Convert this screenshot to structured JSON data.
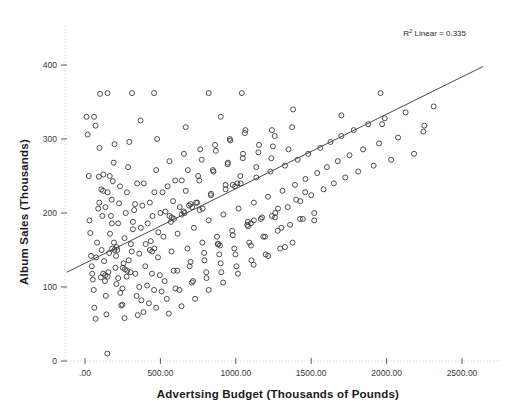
{
  "chart_data": {
    "type": "scatter",
    "title": "",
    "xlabel": "Advertsing Budget (Thousands of Pounds)",
    "ylabel": "Album Sales (Thousands)",
    "xlim": [
      -150,
      2700
    ],
    "ylim": [
      0,
      430
    ],
    "xticks": [
      0,
      500,
      1000,
      1500,
      2000,
      2500
    ],
    "xticklabels": [
      ".00",
      "500.00",
      "1000.00",
      "1500.00",
      "2000.00",
      "2500.00"
    ],
    "yticks": [
      0,
      100,
      200,
      300,
      400
    ],
    "yticklabels": [
      "0",
      "100",
      "200",
      "300",
      "400"
    ],
    "grid": false,
    "legend": null,
    "annotation": {
      "text_prefix": "R",
      "text_sup": "2",
      "text_suffix": " Linear = 0.335",
      "full_text": "R² Linear = 0.335",
      "r_squared": 0.335
    },
    "fit_line": {
      "type": "linear",
      "x_start": -120,
      "y_start": 120,
      "x_end": 2640,
      "y_end": 398,
      "slope": 0.1007,
      "intercept": 132.1
    },
    "marker_style": {
      "shape": "open-circle",
      "size": 5,
      "stroke": "#3b3b3b",
      "fill": "none"
    },
    "series": [
      {
        "name": "Album Sales vs Advertising Budget",
        "points": [
          [
            10,
            330
          ],
          [
            18,
            306
          ],
          [
            25,
            250
          ],
          [
            30,
            190
          ],
          [
            35,
            173
          ],
          [
            40,
            142
          ],
          [
            45,
            128
          ],
          [
            48,
            118
          ],
          [
            52,
            110
          ],
          [
            58,
            96
          ],
          [
            62,
            72
          ],
          [
            70,
            57
          ],
          [
            74,
            140
          ],
          [
            80,
            160
          ],
          [
            88,
            206
          ],
          [
            92,
            249
          ],
          [
            96,
            288
          ],
          [
            100,
            361
          ],
          [
            105,
            113
          ],
          [
            110,
            150
          ],
          [
            115,
            196
          ],
          [
            120,
            230
          ],
          [
            126,
            135
          ],
          [
            132,
            108
          ],
          [
            138,
            88
          ],
          [
            142,
            63
          ],
          [
            148,
            10
          ],
          [
            155,
            120
          ],
          [
            160,
            146
          ],
          [
            166,
            172
          ],
          [
            172,
            196
          ],
          [
            178,
            218
          ],
          [
            184,
            243
          ],
          [
            190,
            268
          ],
          [
            196,
            293
          ],
          [
            202,
            126
          ],
          [
            208,
            104
          ],
          [
            214,
            150
          ],
          [
            220,
            186
          ],
          [
            226,
            213
          ],
          [
            232,
            236
          ],
          [
            240,
            75
          ],
          [
            248,
            98
          ],
          [
            256,
            132
          ],
          [
            262,
            166
          ],
          [
            270,
            200
          ],
          [
            278,
            228
          ],
          [
            286,
            262
          ],
          [
            294,
            296
          ],
          [
            302,
            120
          ],
          [
            310,
            148
          ],
          [
            318,
            178
          ],
          [
            326,
            204
          ],
          [
            334,
            118
          ],
          [
            342,
            88
          ],
          [
            350,
            62
          ],
          [
            360,
            145
          ],
          [
            370,
            180
          ],
          [
            380,
            210
          ],
          [
            390,
            240
          ],
          [
            400,
            128
          ],
          [
            412,
            102
          ],
          [
            424,
            78
          ],
          [
            436,
            162
          ],
          [
            448,
            196
          ],
          [
            460,
            228
          ],
          [
            472,
            258
          ],
          [
            484,
            140
          ],
          [
            496,
            116
          ],
          [
            508,
            94
          ],
          [
            520,
            168
          ],
          [
            534,
            202
          ],
          [
            548,
            236
          ],
          [
            560,
            270
          ],
          [
            574,
            148
          ],
          [
            588,
            122
          ],
          [
            600,
            98
          ],
          [
            614,
            172
          ],
          [
            628,
            208
          ],
          [
            642,
            244
          ],
          [
            656,
            280
          ],
          [
            668,
            316
          ],
          [
            680,
            152
          ],
          [
            694,
            128
          ],
          [
            708,
            106
          ],
          [
            722,
            180
          ],
          [
            736,
            214
          ],
          [
            750,
            250
          ],
          [
            764,
            286
          ],
          [
            778,
            160
          ],
          [
            792,
            136
          ],
          [
            806,
            112
          ],
          [
            820,
            190
          ],
          [
            834,
            224
          ],
          [
            848,
            258
          ],
          [
            862,
            292
          ],
          [
            876,
            168
          ],
          [
            890,
            144
          ],
          [
            904,
            120
          ],
          [
            918,
            198
          ],
          [
            932,
            232
          ],
          [
            946,
            266
          ],
          [
            960,
            300
          ],
          [
            976,
            176
          ],
          [
            990,
            152
          ],
          [
            1004,
            128
          ],
          [
            1018,
            206
          ],
          [
            1032,
            240
          ],
          [
            1046,
            274
          ],
          [
            1060,
            308
          ],
          [
            1076,
            184
          ],
          [
            1090,
            160
          ],
          [
            1104,
            136
          ],
          [
            1120,
            214
          ],
          [
            1136,
            248
          ],
          [
            1150,
            282
          ],
          [
            1166,
            192
          ],
          [
            1182,
            168
          ],
          [
            1198,
            144
          ],
          [
            1214,
            222
          ],
          [
            1230,
            256
          ],
          [
            1246,
            290
          ],
          [
            1262,
            200
          ],
          [
            1278,
            176
          ],
          [
            1294,
            152
          ],
          [
            1310,
            230
          ],
          [
            1326,
            264
          ],
          [
            1344,
            208
          ],
          [
            1360,
            184
          ],
          [
            1376,
            160
          ],
          [
            1392,
            238
          ],
          [
            1410,
            272
          ],
          [
            1428,
            216
          ],
          [
            1444,
            192
          ],
          [
            1462,
            246
          ],
          [
            1480,
            280
          ],
          [
            1500,
            224
          ],
          [
            1520,
            200
          ],
          [
            1540,
            254
          ],
          [
            1560,
            288
          ],
          [
            1582,
            232
          ],
          [
            1604,
            262
          ],
          [
            1628,
            296
          ],
          [
            1650,
            240
          ],
          [
            1676,
            270
          ],
          [
            1700,
            304
          ],
          [
            1726,
            248
          ],
          [
            1754,
            278
          ],
          [
            1782,
            312
          ],
          [
            1812,
            256
          ],
          [
            1844,
            286
          ],
          [
            1878,
            320
          ],
          [
            1914,
            264
          ],
          [
            1950,
            294
          ],
          [
            1988,
            328
          ],
          [
            2030,
            272
          ],
          [
            2076,
            302
          ],
          [
            2126,
            336
          ],
          [
            2182,
            280
          ],
          [
            2244,
            310
          ],
          [
            2312,
            344
          ],
          [
            95,
            214
          ],
          [
            108,
            232
          ],
          [
            122,
            252
          ],
          [
            136,
            208
          ],
          [
            150,
            228
          ],
          [
            164,
            250
          ],
          [
            178,
            186
          ],
          [
            192,
            160
          ],
          [
            206,
            142
          ],
          [
            220,
            112
          ],
          [
            234,
            92
          ],
          [
            248,
            76
          ],
          [
            262,
            58
          ],
          [
            276,
            114
          ],
          [
            290,
            136
          ],
          [
            304,
            158
          ],
          [
            318,
            188
          ],
          [
            332,
            212
          ],
          [
            346,
            240
          ],
          [
            360,
            100
          ],
          [
            374,
            82
          ],
          [
            388,
            66
          ],
          [
            402,
            158
          ],
          [
            416,
            186
          ],
          [
            430,
            214
          ],
          [
            444,
            118
          ],
          [
            458,
            96
          ],
          [
            472,
            72
          ],
          [
            486,
            174
          ],
          [
            500,
            200
          ],
          [
            514,
            228
          ],
          [
            528,
            108
          ],
          [
            542,
            84
          ],
          [
            556,
            64
          ],
          [
            570,
            188
          ],
          [
            584,
            216
          ],
          [
            598,
            244
          ],
          [
            612,
            122
          ],
          [
            626,
            96
          ],
          [
            640,
            74
          ],
          [
            654,
            202
          ],
          [
            668,
            230
          ],
          [
            682,
            258
          ],
          [
            700,
            134
          ],
          [
            716,
            108
          ],
          [
            730,
            84
          ],
          [
            744,
            214
          ],
          [
            758,
            244
          ],
          [
            774,
            272
          ],
          [
            790,
            146
          ],
          [
            804,
            120
          ],
          [
            820,
            96
          ],
          [
            836,
            226
          ],
          [
            852,
            256
          ],
          [
            868,
            284
          ],
          [
            884,
            158
          ],
          [
            900,
            132
          ],
          [
            916,
            106
          ],
          [
            932,
            238
          ],
          [
            948,
            268
          ],
          [
            964,
            298
          ],
          [
            980,
            170
          ],
          [
            998,
            144
          ],
          [
            1014,
            118
          ],
          [
            1030,
            250
          ],
          [
            1048,
            280
          ],
          [
            1064,
            312
          ],
          [
            1082,
            182
          ],
          [
            1100,
            156
          ],
          [
            1118,
            130
          ],
          [
            1136,
            262
          ],
          [
            1154,
            292
          ],
          [
            1174,
            194
          ],
          [
            1194,
            168
          ],
          [
            1214,
            142
          ],
          [
            1236,
            274
          ],
          [
            1258,
            304
          ],
          [
            1280,
            206
          ],
          [
            1302,
            180
          ],
          [
            1326,
            154
          ],
          [
            1350,
            286
          ],
          [
            1374,
            316
          ],
          [
            1400,
            218
          ],
          [
            1426,
            192
          ],
          [
            60,
            330
          ],
          [
            70,
            318
          ],
          [
            150,
            362
          ],
          [
            312,
            362
          ],
          [
            368,
            325
          ],
          [
            458,
            362
          ],
          [
            478,
            300
          ],
          [
            820,
            362
          ],
          [
            900,
            330
          ],
          [
            1040,
            362
          ],
          [
            1240,
            312
          ],
          [
            1380,
            340
          ],
          [
            1520,
            190
          ],
          [
            1700,
            332
          ],
          [
            1960,
            362
          ],
          [
            1970,
            320
          ],
          [
            2250,
            318
          ],
          [
            700,
            212
          ],
          [
            710,
            208
          ],
          [
            690,
            210
          ],
          [
            760,
            204
          ],
          [
            780,
            206
          ],
          [
            560,
            196
          ],
          [
            575,
            194
          ],
          [
            590,
            192
          ],
          [
            640,
            198
          ],
          [
            660,
            200
          ],
          [
            430,
            150
          ],
          [
            445,
            148
          ],
          [
            460,
            152
          ],
          [
            250,
            126
          ],
          [
            265,
            124
          ],
          [
            280,
            122
          ],
          [
            180,
            152
          ],
          [
            195,
            150
          ],
          [
            210,
            154
          ],
          [
            120,
            118
          ],
          [
            135,
            116
          ],
          [
            150,
            114
          ],
          [
            1080,
            188
          ],
          [
            1100,
            186
          ],
          [
            1120,
            190
          ],
          [
            1240,
            196
          ],
          [
            1260,
            194
          ],
          [
            880,
            158
          ],
          [
            895,
            156
          ],
          [
            1460,
            228
          ],
          [
            980,
            238
          ],
          [
            995,
            236
          ],
          [
            1010,
            240
          ]
        ]
      }
    ]
  },
  "annotation_text": "R² Linear = 0.335"
}
